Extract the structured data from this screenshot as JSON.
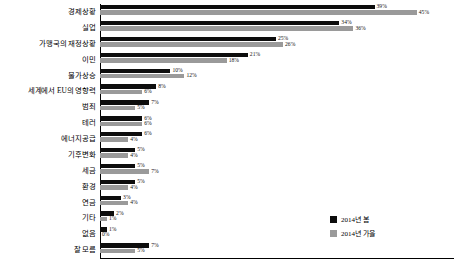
{
  "chart_data": {
    "type": "bar",
    "orientation": "horizontal",
    "title": "",
    "xlabel": "",
    "ylabel": "",
    "xlim": [
      0,
      50
    ],
    "grid": false,
    "legend_position": "bottom-right",
    "value_suffix": "%",
    "categories": [
      "경제상황",
      "실업",
      "가맹국의 재정상황",
      "이민",
      "물가상승",
      "세계에서 EU의 영향력",
      "범죄",
      "테러",
      "에너지공급",
      "기후변화",
      "세금",
      "환경",
      "연금",
      "기타",
      "없음",
      "잘 모름"
    ],
    "series": [
      {
        "name": "2014년 봄",
        "color": "#0d0d0d",
        "values": [
          39,
          34,
          25,
          21,
          10,
          8,
          7,
          6,
          6,
          5,
          5,
          5,
          3,
          2,
          1,
          7
        ],
        "labels": [
          "39%",
          "34%",
          "25%",
          "21%",
          "10%",
          "8%",
          "7%",
          "6%",
          "6%",
          "5%",
          "5%",
          "5%",
          "3%",
          "2%",
          "1%",
          "7%"
        ]
      },
      {
        "name": "2014년 가을",
        "color": "#9a9a9a",
        "values": [
          45,
          36,
          26,
          18,
          12,
          6,
          5,
          6,
          4,
          4,
          7,
          4,
          4,
          1,
          0,
          5
        ],
        "labels": [
          "45%",
          "36%",
          "26%",
          "18%",
          "12%",
          "6%",
          "5%",
          "6%",
          "4%",
          "4%",
          "7%",
          "4%",
          "4%",
          "1%",
          "0%",
          "5%"
        ]
      }
    ]
  },
  "legend": {
    "items": [
      {
        "label": "2014년 봄",
        "color": "#0d0d0d"
      },
      {
        "label": "2014년 가을",
        "color": "#9a9a9a"
      }
    ]
  }
}
